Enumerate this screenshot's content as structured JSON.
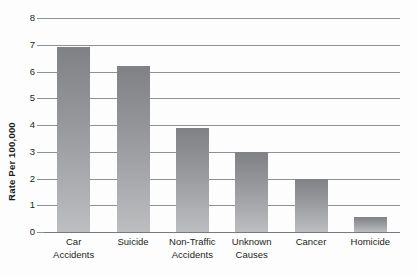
{
  "chart_data": {
    "type": "bar",
    "title": "",
    "xlabel": "",
    "ylabel": "Rate Per 100,000",
    "ylim": [
      0,
      8
    ],
    "ytick_step": 1,
    "grid": true,
    "legend": "none",
    "categories": [
      "Car Accidents",
      "Suicide",
      "Non-Traffic Accidents",
      "Unknown Causes",
      "Cancer",
      "Homicide"
    ],
    "category_lines": [
      [
        "Car",
        "Accidents"
      ],
      [
        "Suicide"
      ],
      [
        "Non-Traffic",
        "Accidents"
      ],
      [
        "Unknown",
        "Causes"
      ],
      [
        "Cancer"
      ],
      [
        "Homicide"
      ]
    ],
    "values": [
      6.9,
      6.2,
      3.9,
      3.0,
      2.0,
      0.55
    ],
    "ytick_labels": [
      "8",
      "7",
      "6",
      "5",
      "4",
      "3",
      "2",
      "1",
      "0"
    ],
    "bar_color_top": "#808184",
    "bar_color_bottom": "#bcbec0",
    "gridline_color": "#8d9094",
    "background_color": "#fdfdfd",
    "text_color": "#231f20"
  }
}
